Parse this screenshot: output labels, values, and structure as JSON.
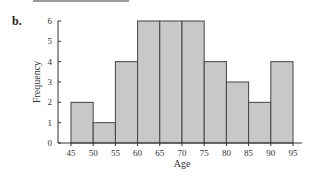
{
  "panel_label": "b.",
  "colors": {
    "bar_fill": "#c8c8c8",
    "bar_stroke": "#444444",
    "axis": "#333333",
    "top_rule": "#9a9a9a"
  },
  "chart_data": {
    "type": "bar",
    "subtype": "histogram",
    "title": "",
    "xlabel": "Age",
    "ylabel": "Frequency",
    "bin_edges": [
      45,
      50,
      55,
      60,
      65,
      70,
      75,
      80,
      85,
      90,
      95
    ],
    "categories": [
      "45-50",
      "50-55",
      "55-60",
      "60-65",
      "65-70",
      "70-75",
      "75-80",
      "80-85",
      "85-90",
      "90-95"
    ],
    "values": [
      2,
      1,
      4,
      6,
      6,
      6,
      4,
      3,
      2,
      4
    ],
    "x_ticks": [
      "45",
      "50",
      "55",
      "60",
      "65",
      "70",
      "75",
      "80",
      "85",
      "90",
      "95"
    ],
    "y_ticks": [
      "0",
      "1",
      "2",
      "3",
      "4",
      "5",
      "6"
    ],
    "ylim": [
      0,
      6
    ],
    "xlim": [
      45,
      95
    ],
    "grid": false,
    "legend": null
  }
}
